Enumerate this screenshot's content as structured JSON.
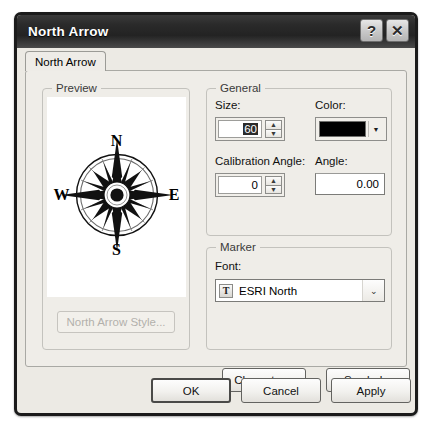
{
  "window": {
    "title": "North Arrow",
    "help_button": "?",
    "close_button": "✕"
  },
  "tabs": [
    {
      "label": "North Arrow",
      "active": true
    }
  ],
  "preview": {
    "group_label": "Preview",
    "compass": {
      "north": "N",
      "south": "S",
      "west": "W",
      "east": "E"
    },
    "style_button": "North Arrow Style...",
    "style_button_enabled": false
  },
  "general": {
    "group_label": "General",
    "size": {
      "label": "Size:",
      "value": "60",
      "selected": true,
      "spin_up": "▲",
      "spin_down": "▼"
    },
    "color": {
      "label": "Color:",
      "value": "#000000",
      "dropdown_arrow": "▼"
    },
    "calibration_angle": {
      "label": "Calibration Angle:",
      "value": "0",
      "spin_up": "▲",
      "spin_down": "▼"
    },
    "angle": {
      "label": "Angle:",
      "value": "0.00"
    }
  },
  "marker": {
    "group_label": "Marker",
    "font": {
      "label": "Font:",
      "value": "ESRI North",
      "type_icon": "T",
      "dropdown_arrow": "⌄"
    },
    "character_button": "Character...",
    "symbol_button": "Symbol..."
  },
  "footer": {
    "ok": "OK",
    "cancel": "Cancel",
    "apply": "Apply"
  }
}
